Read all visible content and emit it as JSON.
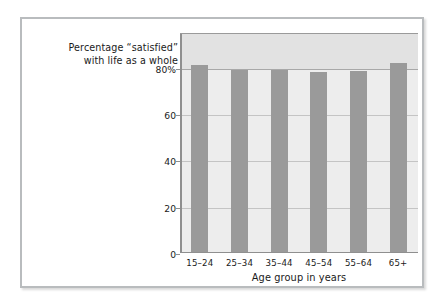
{
  "figure": {
    "frame_border_color": "#b9bcbe",
    "background_color": "#ffffff"
  },
  "caption": {
    "line1": "Percentage “satisfied”",
    "line2": "with life as a whole"
  },
  "chart_data": {
    "type": "bar",
    "title": "Percentage “satisfied” with life as a whole",
    "xlabel": "Age group in years",
    "ylabel": "",
    "categories": [
      "15–24",
      "25–34",
      "35–44",
      "45–54",
      "55–64",
      "65+"
    ],
    "values": [
      81,
      79,
      79,
      78,
      78.5,
      82
    ],
    "ylim": [
      0,
      95
    ],
    "yticks": [
      0,
      20,
      40,
      60,
      80
    ],
    "ytick_labels": [
      "0",
      "20",
      "40",
      "60",
      "80%"
    ],
    "grid": true,
    "legend": null,
    "bar_color": "#9a9a9a",
    "plot_background_color": "#ededed",
    "band_above_80_color": "#e2e2e2",
    "gridline_color": "#c4c4c4"
  }
}
